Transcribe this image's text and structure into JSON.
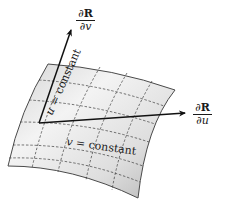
{
  "figure": {
    "colors": {
      "surface_light": "#f2f2f2",
      "surface_dark": "#b8b8b8",
      "edge": "#4a4a4a",
      "grid": "#3a3a3a",
      "arrow": "#111111"
    },
    "vectors": [
      {
        "name": "dR_dv",
        "numerator": "∂R",
        "denominator": "∂v",
        "num_symbol": "∂",
        "num_var": "R",
        "den_symbol": "∂",
        "den_var": "v"
      },
      {
        "name": "dR_du",
        "numerator": "∂R",
        "denominator": "∂u",
        "num_symbol": "∂",
        "num_var": "R",
        "den_symbol": "∂",
        "den_var": "u"
      }
    ],
    "curve_labels": {
      "u_constant": {
        "var": "u",
        "text": " = constant"
      },
      "v_constant": {
        "var": "v",
        "text": " = constant"
      }
    }
  }
}
